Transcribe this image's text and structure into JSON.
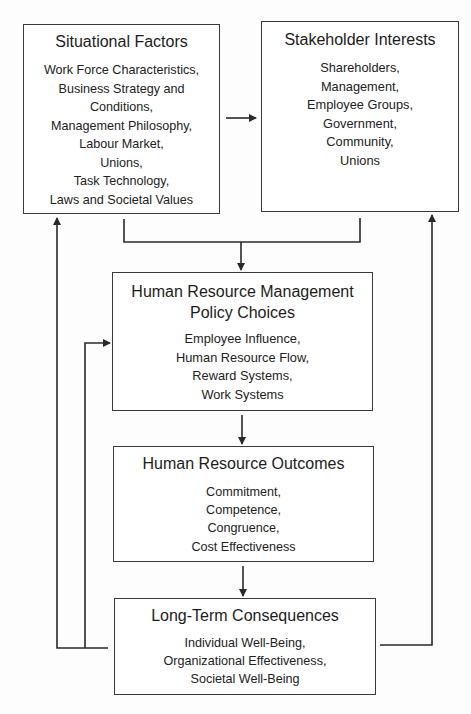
{
  "diagram": {
    "boxes": {
      "situational": {
        "title": "Situational Factors",
        "items": [
          "Work Force Characteristics,",
          "Business Strategy and",
          "Conditions,",
          "Management Philosophy,",
          "Labour Market,",
          "Unions,",
          "Task Technology,",
          "Laws and Societal Values"
        ]
      },
      "stakeholder": {
        "title": "Stakeholder Interests",
        "items": [
          "Shareholders,",
          "Management,",
          "Employee Groups,",
          "Government,",
          "Community,",
          "Unions"
        ]
      },
      "hrm": {
        "title_line1": "Human Resource Management",
        "title_line2": "Policy Choices",
        "items": [
          "Employee Influence,",
          "Human Resource Flow,",
          "Reward Systems,",
          "Work Systems"
        ]
      },
      "outcomes": {
        "title": "Human Resource Outcomes",
        "items": [
          "Commitment,",
          "Competence,",
          "Congruence,",
          "Cost Effectiveness"
        ]
      },
      "consequences": {
        "title": "Long-Term Consequences",
        "items": [
          "Individual Well-Being,",
          "Organizational Effectiveness,",
          "Societal Well-Being"
        ]
      }
    },
    "connections": [
      {
        "from": "situational",
        "to": "stakeholder",
        "type": "arrow"
      },
      {
        "from": "situational+stakeholder",
        "to": "hrm",
        "type": "merge-arrow"
      },
      {
        "from": "hrm",
        "to": "outcomes",
        "type": "arrow"
      },
      {
        "from": "outcomes",
        "to": "consequences",
        "type": "arrow"
      },
      {
        "from": "consequences",
        "to": "situational",
        "type": "feedback-arrow"
      },
      {
        "from": "consequences",
        "to": "hrm",
        "type": "feedback-arrow"
      },
      {
        "from": "consequences",
        "to": "stakeholder",
        "type": "feedback-arrow"
      }
    ],
    "colors": {
      "line": "#2a2a2a",
      "box_border": "#3a3a3a",
      "background": "#fdfdfd"
    }
  }
}
